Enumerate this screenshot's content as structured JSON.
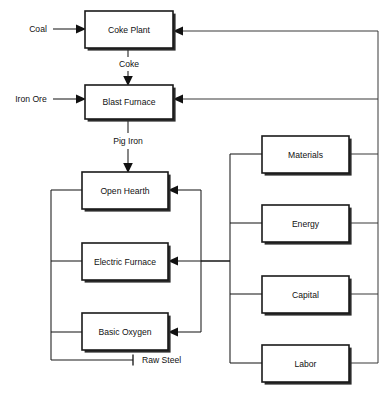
{
  "diagram": {
    "background_color": "#ffffff",
    "line_color": "#1a1a1a",
    "text_color": "#111111",
    "process_nodes": [
      {
        "id": "coke-plant",
        "label": "Coke Plant",
        "x": 85,
        "y": 11,
        "w": 88,
        "h": 37
      },
      {
        "id": "blast-furnace",
        "label": "Blast Furnace",
        "x": 85,
        "y": 85,
        "w": 88,
        "h": 34
      },
      {
        "id": "open-hearth",
        "label": "Open Hearth",
        "x": 82,
        "y": 172,
        "w": 86,
        "h": 37
      },
      {
        "id": "electric-furnace",
        "label": "Electric Furnace",
        "x": 82,
        "y": 243,
        "w": 86,
        "h": 37
      },
      {
        "id": "basic-oxygen",
        "label": "Basic Oxygen",
        "x": 82,
        "y": 313,
        "w": 86,
        "h": 37
      }
    ],
    "resource_nodes": [
      {
        "id": "materials",
        "label": "Materials",
        "x": 262,
        "y": 136,
        "w": 87,
        "h": 37
      },
      {
        "id": "energy",
        "label": "Energy",
        "x": 262,
        "y": 205,
        "w": 87,
        "h": 37
      },
      {
        "id": "capital",
        "label": "Capital",
        "x": 262,
        "y": 276,
        "w": 87,
        "h": 37
      },
      {
        "id": "labor",
        "label": "Labor",
        "x": 262,
        "y": 345,
        "w": 87,
        "h": 37
      }
    ],
    "flow_labels": [
      {
        "id": "coal-input",
        "text": "Coal",
        "x": 38,
        "y": 29
      },
      {
        "id": "iron-ore-input",
        "text": "Iron Ore",
        "x": 31,
        "y": 99
      },
      {
        "id": "coke-flow",
        "text": "Coke",
        "x": 129,
        "y": 64
      },
      {
        "id": "pig-iron-flow",
        "text": "Pig Iron",
        "x": 128,
        "y": 141
      },
      {
        "id": "raw-steel-out",
        "text": "Raw Steel",
        "x": 167,
        "y": 361
      }
    ],
    "connections": [
      {
        "from": "Coal",
        "to": "Coke Plant",
        "type": "arrow"
      },
      {
        "from": "Coke Plant",
        "to": "Blast Furnace",
        "type": "arrow",
        "label": "Coke"
      },
      {
        "from": "Iron Ore",
        "to": "Blast Furnace",
        "type": "arrow"
      },
      {
        "from": "Blast Furnace",
        "to": "Open Hearth",
        "type": "arrow",
        "label": "Pig Iron"
      },
      {
        "from": "Resource Bus",
        "to": "Coke Plant",
        "type": "arrow"
      },
      {
        "from": "Resource Bus",
        "to": "Blast Furnace",
        "type": "arrow"
      },
      {
        "from": "Resource Bus",
        "to": "Open Hearth",
        "type": "arrow"
      },
      {
        "from": "Resource Bus",
        "to": "Electric Furnace",
        "type": "arrow"
      },
      {
        "from": "Resource Bus",
        "to": "Basic Oxygen",
        "type": "arrow"
      },
      {
        "from": "Open Hearth",
        "to": "Raw Steel",
        "type": "terminator"
      },
      {
        "from": "Electric Furnace",
        "to": "Raw Steel",
        "type": "terminator"
      },
      {
        "from": "Basic Oxygen",
        "to": "Raw Steel",
        "type": "terminator"
      }
    ]
  }
}
